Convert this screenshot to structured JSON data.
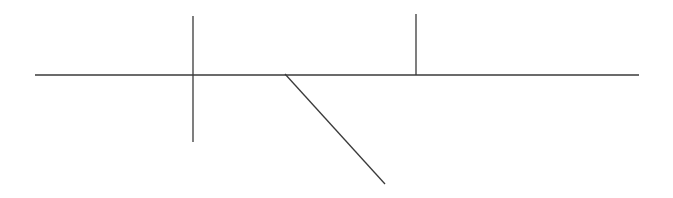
{
  "diagram": {
    "canvas": {
      "width": 673,
      "height": 198,
      "background": "#ffffff"
    },
    "stroke_color": "#3a3a3a",
    "lines": [
      {
        "name": "horizontal-baseline",
        "x1": 35,
        "y1": 75,
        "x2": 639,
        "y2": 75
      },
      {
        "name": "vertical-crossing-line",
        "x1": 193,
        "y1": 16,
        "x2": 193,
        "y2": 142
      },
      {
        "name": "vertical-upper-line",
        "x1": 416,
        "y1": 14,
        "x2": 416,
        "y2": 75
      },
      {
        "name": "diagonal-line",
        "x1": 285,
        "y1": 74,
        "x2": 385,
        "y2": 184
      }
    ]
  }
}
